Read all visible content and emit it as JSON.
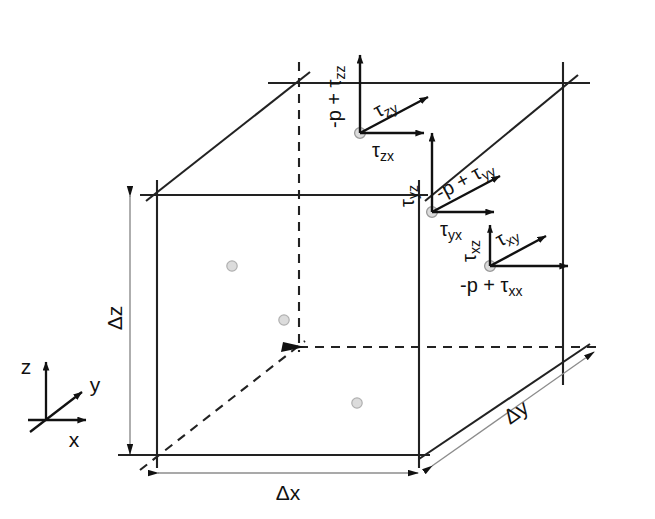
{
  "figure": {
    "type": "diagram",
    "background_color": "#ffffff",
    "line_color": "#222222",
    "dim_line_color": "#999999",
    "dot_fill": "#d9d9d9",
    "dot_stroke": "#aaaaaa"
  },
  "axes": {
    "z_label": "z",
    "y_label": "y",
    "x_label": "x"
  },
  "dimensions": {
    "dz": "Δz",
    "dx": "Δx",
    "dy": "Δy"
  },
  "faces": {
    "z_face": {
      "normal_label_prefix": "-p + ",
      "normal_label_tau": "τ",
      "normal_label_sub": "zz",
      "normal_label_full": "-p + τzz",
      "shear_diag_tau": "τ",
      "shear_diag_sub": "zy",
      "shear_horiz_tau": "τ",
      "shear_horiz_sub": "zx"
    },
    "y_face": {
      "normal_label_prefix": "-p + ",
      "normal_label_tau": "τ",
      "normal_label_sub": "yy",
      "normal_label_full": "-p + τyy",
      "shear_vert_tau": "τ",
      "shear_vert_sub": "yz",
      "shear_horiz_tau": "τ",
      "shear_horiz_sub": "yx"
    },
    "x_face": {
      "normal_label_prefix": "-p + ",
      "normal_label_tau": "τ",
      "normal_label_sub": "xx",
      "normal_label_full": "-p + τxx",
      "shear_vert_tau": "τ",
      "shear_vert_sub": "xz",
      "shear_diag_tau": "τ",
      "shear_diag_sub": "xy"
    }
  }
}
